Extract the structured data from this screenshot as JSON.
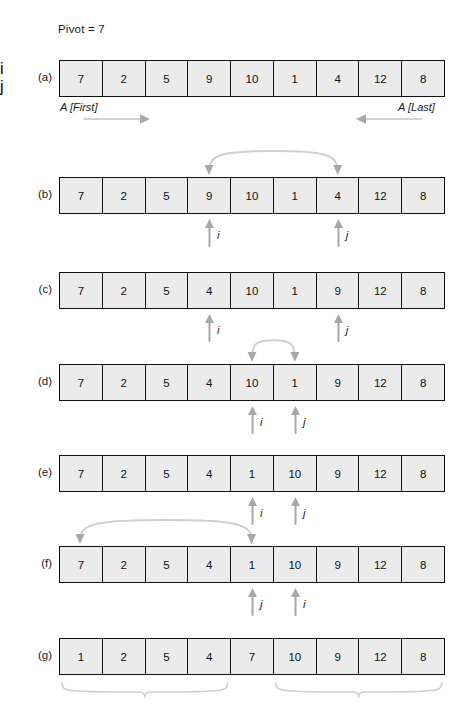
{
  "figure": {
    "pivot_text": "Pivot = 7",
    "array_length": 9,
    "end_labels": {
      "first": "A [First]",
      "last": "A [Last]"
    },
    "pointer_names": {
      "i": "i",
      "j": "j"
    },
    "rows": [
      {
        "label": "(a)",
        "values": [
          "7",
          "2",
          "5",
          "9",
          "10",
          "1",
          "4",
          "12",
          "8"
        ],
        "pointers": [],
        "swap_arc": null,
        "horizontal_moves": [
          {
            "name": "i",
            "from_index": 0,
            "direction": "right"
          },
          {
            "name": "j",
            "from_index": 8,
            "direction": "left"
          }
        ],
        "end_labels": true,
        "braces": []
      },
      {
        "label": "(b)",
        "values": [
          "7",
          "2",
          "5",
          "9",
          "10",
          "1",
          "4",
          "12",
          "8"
        ],
        "pointers": [
          {
            "name": "i",
            "index": 3
          },
          {
            "name": "j",
            "index": 6
          }
        ],
        "swap_arc": {
          "from_index": 3,
          "to_index": 6
        },
        "horizontal_moves": [],
        "end_labels": false,
        "braces": []
      },
      {
        "label": "(c)",
        "values": [
          "7",
          "2",
          "5",
          "4",
          "10",
          "1",
          "9",
          "12",
          "8"
        ],
        "pointers": [
          {
            "name": "i",
            "index": 3
          },
          {
            "name": "j",
            "index": 6
          }
        ],
        "swap_arc": null,
        "horizontal_moves": [],
        "end_labels": false,
        "braces": []
      },
      {
        "label": "(d)",
        "values": [
          "7",
          "2",
          "5",
          "4",
          "10",
          "1",
          "9",
          "12",
          "8"
        ],
        "pointers": [
          {
            "name": "i",
            "index": 4
          },
          {
            "name": "j",
            "index": 5
          }
        ],
        "swap_arc": {
          "from_index": 4,
          "to_index": 5
        },
        "horizontal_moves": [],
        "end_labels": false,
        "braces": []
      },
      {
        "label": "(e)",
        "values": [
          "7",
          "2",
          "5",
          "4",
          "1",
          "10",
          "9",
          "12",
          "8"
        ],
        "pointers": [
          {
            "name": "i",
            "index": 4
          },
          {
            "name": "j",
            "index": 5
          }
        ],
        "swap_arc": null,
        "horizontal_moves": [],
        "end_labels": false,
        "braces": []
      },
      {
        "label": "(f)",
        "values": [
          "7",
          "2",
          "5",
          "4",
          "1",
          "10",
          "9",
          "12",
          "8"
        ],
        "pointers": [
          {
            "name": "j",
            "index": 4
          },
          {
            "name": "i",
            "index": 5
          }
        ],
        "swap_arc": {
          "from_index": 0,
          "to_index": 4
        },
        "horizontal_moves": [],
        "end_labels": false,
        "braces": []
      },
      {
        "label": "(g)",
        "values": [
          "1",
          "2",
          "5",
          "4",
          "7",
          "10",
          "9",
          "12",
          "8"
        ],
        "pointers": [],
        "swap_arc": null,
        "horizontal_moves": [],
        "end_labels": false,
        "braces": [
          {
            "from_index": 0,
            "to_index": 3
          },
          {
            "from_index": 5,
            "to_index": 8
          }
        ]
      }
    ]
  },
  "colors": {
    "cell_fill": "#ebebeb",
    "cell_border": "#111111",
    "arrow_gray": "#a8a8a8",
    "arc_stroke": "#cfcfcf",
    "text": "#1a1a1a"
  }
}
